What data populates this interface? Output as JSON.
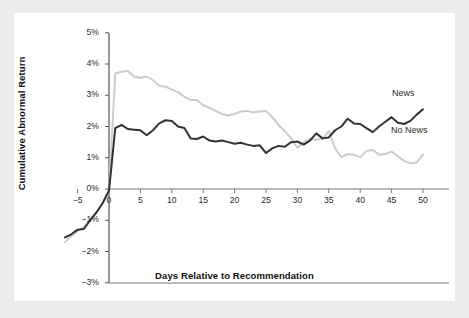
{
  "figure": {
    "background_color": "#ececec",
    "panel_color": "#ffffff"
  },
  "axis_titles": {
    "x": "Days Relative to Recommendation",
    "y": "Cumulative Abnormal Return"
  },
  "series_labels": {
    "news": "News",
    "no_news": "No News"
  },
  "chart_data": {
    "type": "line",
    "title": "",
    "subtitle": "",
    "xlabel": "Days Relative to Recommendation",
    "ylabel": "Cumulative Abnormal Return",
    "xlim": [
      -7,
      51
    ],
    "ylim": [
      -3,
      5
    ],
    "xticks": [
      -5,
      0,
      5,
      10,
      15,
      20,
      25,
      30,
      35,
      40,
      45,
      50
    ],
    "xtick_labels": [
      "−5",
      "0",
      "5",
      "10",
      "15",
      "20",
      "25",
      "30",
      "35",
      "40",
      "45",
      "50"
    ],
    "yticks": [
      5,
      4,
      3,
      2,
      1,
      0,
      -1,
      -2,
      -3
    ],
    "ytick_labels": [
      "5%",
      "4%",
      "3%",
      "2%",
      "1%",
      "0%",
      "−1%",
      "−2%",
      "−3%"
    ],
    "grid": false,
    "legend_position": "inline-right-annotations",
    "units": "percent",
    "zero_line": true,
    "x": [
      -7,
      -6,
      -5,
      -4,
      -3,
      -2,
      -1,
      0,
      1,
      2,
      3,
      4,
      5,
      6,
      7,
      8,
      9,
      10,
      11,
      12,
      13,
      14,
      15,
      16,
      17,
      18,
      19,
      20,
      21,
      22,
      23,
      24,
      25,
      26,
      27,
      28,
      29,
      30,
      31,
      32,
      33,
      34,
      35,
      36,
      37,
      38,
      39,
      40,
      41,
      42,
      43,
      44,
      45,
      46,
      47,
      48,
      49,
      50
    ],
    "series": [
      {
        "name": "News",
        "color": "#333333",
        "line_width": 2.0,
        "values": [
          -1.55,
          -1.45,
          -1.3,
          -1.28,
          -1.0,
          -0.75,
          -0.45,
          -0.05,
          1.95,
          2.05,
          1.92,
          1.9,
          1.88,
          1.72,
          1.88,
          2.1,
          2.2,
          2.18,
          2.0,
          1.95,
          1.62,
          1.6,
          1.68,
          1.55,
          1.52,
          1.55,
          1.5,
          1.45,
          1.48,
          1.42,
          1.38,
          1.4,
          1.15,
          1.3,
          1.38,
          1.35,
          1.5,
          1.52,
          1.42,
          1.55,
          1.78,
          1.62,
          1.65,
          1.88,
          2.0,
          2.25,
          2.1,
          2.08,
          1.95,
          1.82,
          2.0,
          2.15,
          2.3,
          2.12,
          2.08,
          2.18,
          2.38,
          2.55
        ]
      },
      {
        "name": "No News",
        "color": "#cccccc",
        "line_width": 2.0,
        "values": [
          -1.7,
          -1.5,
          -1.35,
          -1.2,
          -1.0,
          -0.75,
          -0.45,
          -0.05,
          3.7,
          3.75,
          3.78,
          3.6,
          3.55,
          3.6,
          3.48,
          3.3,
          3.28,
          3.18,
          3.1,
          2.95,
          2.85,
          2.85,
          2.68,
          2.6,
          2.5,
          2.4,
          2.35,
          2.4,
          2.48,
          2.5,
          2.45,
          2.48,
          2.5,
          2.3,
          2.05,
          1.85,
          1.62,
          1.32,
          1.5,
          1.6,
          1.58,
          1.6,
          1.85,
          1.3,
          1.02,
          1.12,
          1.1,
          1.02,
          1.22,
          1.25,
          1.1,
          1.12,
          1.2,
          1.05,
          0.9,
          0.82,
          0.85,
          1.1
        ]
      }
    ]
  }
}
